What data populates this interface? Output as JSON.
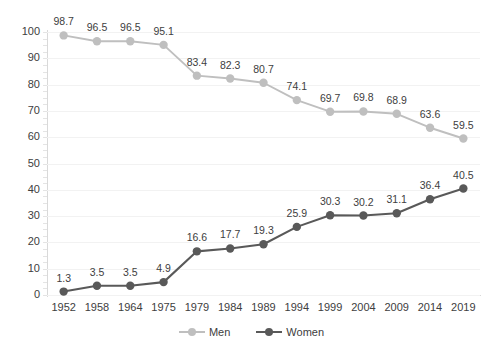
{
  "chart_data": {
    "type": "line",
    "title": "",
    "subtitle": "",
    "xlabel": "",
    "ylabel": "",
    "ylim": [
      0,
      100
    ],
    "ytick_step": 10,
    "yticks": [
      0,
      10,
      20,
      30,
      40,
      50,
      60,
      70,
      80,
      90,
      100
    ],
    "grid": true,
    "grid_axis": "y",
    "legend_position": "bottom-center",
    "data_labels": true,
    "categories": [
      "1952",
      "1958",
      "1964",
      "1975",
      "1979",
      "1984",
      "1989",
      "1994",
      "1999",
      "2004",
      "2009",
      "2014",
      "2019"
    ],
    "series": [
      {
        "name": "Men",
        "color": "#bfbfbf",
        "marker": "circle",
        "values": [
          98.7,
          96.5,
          96.5,
          95.1,
          83.4,
          82.3,
          80.7,
          74.1,
          69.7,
          69.8,
          68.9,
          63.6,
          59.5
        ],
        "labels": [
          "98.7",
          "96.5",
          "96.5",
          "95.1",
          "83.4",
          "82.3",
          "80.7",
          "74.1",
          "69.7",
          "69.8",
          "68.9",
          "63.6",
          "59.5"
        ]
      },
      {
        "name": "Women",
        "color": "#595959",
        "marker": "circle",
        "values": [
          1.3,
          3.5,
          3.5,
          4.9,
          16.6,
          17.7,
          19.3,
          25.9,
          30.3,
          30.2,
          31.1,
          36.4,
          40.5
        ],
        "labels": [
          "1.3",
          "3.5",
          "3.5",
          "4.9",
          "16.6",
          "17.7",
          "19.3",
          "25.9",
          "30.3",
          "30.2",
          "31.1",
          "36.4",
          "40.5"
        ]
      }
    ]
  },
  "legend": {
    "items": [
      {
        "label": "Men",
        "color": "#bfbfbf"
      },
      {
        "label": "Women",
        "color": "#595959"
      }
    ]
  },
  "axes": {
    "y_tick_labels": [
      "0",
      "10",
      "20",
      "30",
      "40",
      "50",
      "60",
      "70",
      "80",
      "90",
      "100"
    ],
    "x_tick_labels": [
      "1952",
      "1958",
      "1964",
      "1975",
      "1979",
      "1984",
      "1989",
      "1994",
      "1999",
      "2004",
      "2009",
      "2014",
      "2019"
    ]
  },
  "colors": {
    "men": "#bfbfbf",
    "women": "#595959",
    "gridline": "#f2f2f2",
    "axis": "#d9d9d9",
    "text": "#404040",
    "background": "#ffffff"
  }
}
